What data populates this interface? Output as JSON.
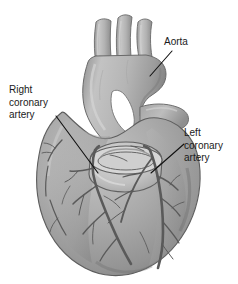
{
  "figure": {
    "type": "anatomical-illustration",
    "style": "grayscale pencil / airbrush medical illustration",
    "background_color": "#ffffff"
  },
  "labels": [
    {
      "id": "aorta",
      "text": "Aorta",
      "lines": [
        "Aorta"
      ],
      "position": {
        "x": 164,
        "y": 36
      },
      "leader_line": {
        "x1": 172,
        "y1": 51,
        "x2": 150,
        "y2": 76
      }
    },
    {
      "id": "right-coronary-artery",
      "text": "Right coronary artery",
      "lines": [
        "Right",
        "coronary",
        "artery"
      ],
      "position": {
        "x": 9,
        "y": 84
      },
      "leader_line": {
        "x1": 56,
        "y1": 117,
        "x2": 97,
        "y2": 172
      }
    },
    {
      "id": "left-coronary-artery",
      "text": "Left coronary artery",
      "lines": [
        "Left",
        "coronary",
        "artery"
      ],
      "position": {
        "x": 184,
        "y": 127
      },
      "leader_line": {
        "x1": 182,
        "y1": 144,
        "x2": 152,
        "y2": 172
      }
    }
  ],
  "colors": {
    "background": "#ffffff",
    "label_text": "#1a1a1a",
    "leader_line": "#111111",
    "myocardium_light": "#c9c9c9",
    "myocardium_mid": "#a9a9a9",
    "myocardium_dark": "#8a8a8a",
    "myocardium_shadow": "#6f6f6f",
    "vessel_outline": "#5d5d5d",
    "aorta_light": "#bdbdbd",
    "aorta_dark": "#8f8f8f",
    "outline": "#5a5a5a",
    "lumen_inner": "#e8e8e8"
  },
  "anatomy": {
    "great_vessels": [
      {
        "name": "brachiocephalic-trunk"
      },
      {
        "name": "left-common-carotid-artery"
      },
      {
        "name": "left-subclavian-artery"
      }
    ],
    "structures": [
      {
        "name": "aortic-arch"
      },
      {
        "name": "ascending-aorta"
      },
      {
        "name": "cut-aorta-stump"
      },
      {
        "name": "pulmonary-trunk"
      },
      {
        "name": "left-atrial-appendage"
      },
      {
        "name": "right-ventricle"
      },
      {
        "name": "left-ventricle"
      },
      {
        "name": "apex-of-heart"
      }
    ]
  }
}
